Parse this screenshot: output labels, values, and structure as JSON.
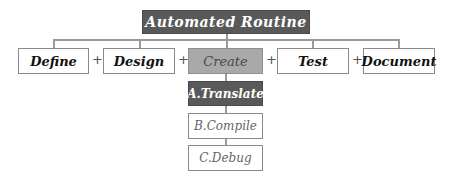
{
  "diagram": {
    "root": {
      "label": "Automated Routine"
    },
    "steps": [
      {
        "label": "Define",
        "highlighted": false
      },
      {
        "label": "Design",
        "highlighted": false
      },
      {
        "label": "Create",
        "highlighted": true
      },
      {
        "label": "Test",
        "highlighted": false
      },
      {
        "label": "Document",
        "highlighted": false
      }
    ],
    "operator": "+",
    "substeps": [
      {
        "label": "A.Translate",
        "active": true
      },
      {
        "label": "B.Compile",
        "active": false
      },
      {
        "label": "C.Debug",
        "active": false
      }
    ],
    "colors": {
      "root_fill": "#595959",
      "highlight_fill": "#a9a9a9",
      "active_fill": "#595959",
      "border": "#8a8a8a"
    }
  }
}
